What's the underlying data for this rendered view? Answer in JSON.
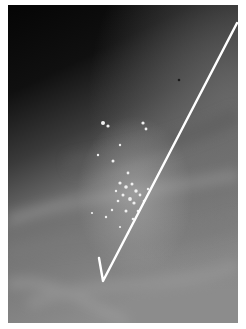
{
  "image": {
    "subject": "mammogram with localization hook wire",
    "features": [
      "dark upper region",
      "gray fibroglandular tissue",
      "cluster of bright microcalcifications",
      "white hook wire"
    ],
    "colors": {
      "background": "#0a0a0a",
      "tissue": "#8a8a8a",
      "wire": "#ffffff",
      "border": "#ffffff"
    }
  }
}
